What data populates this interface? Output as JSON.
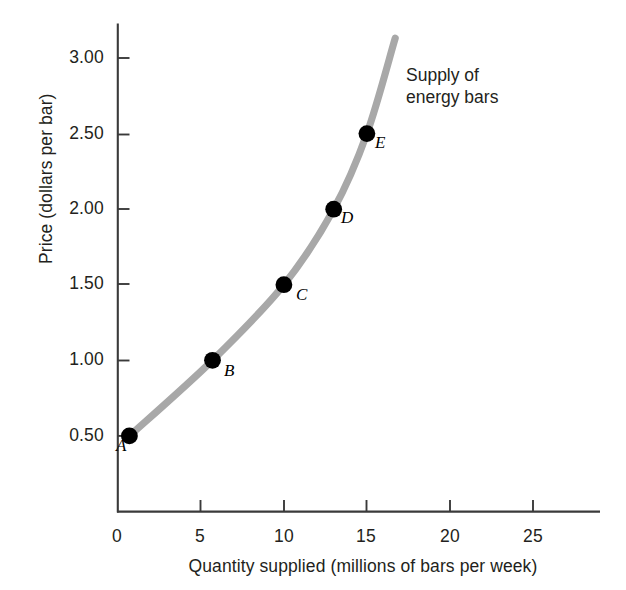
{
  "chart_data": {
    "type": "line",
    "title": "",
    "annotation": "Supply of energy bars",
    "annotation_line1": "Supply of",
    "annotation_line2": "energy bars",
    "xlabel": "Quantity supplied (millions of bars per week)",
    "ylabel": "Price (dollars per bar)",
    "xlim": [
      0,
      27.5
    ],
    "ylim": [
      0,
      3.3
    ],
    "grid": false,
    "legend": false,
    "curve_color": "#a8a8a8",
    "point_color": "#000000",
    "axis_color": "#3a3a3a",
    "xticks": [
      0,
      5,
      10,
      15,
      20,
      25
    ],
    "xtick_labels": [
      "0",
      "5",
      "10",
      "15",
      "20",
      "25"
    ],
    "yticks": [
      0.5,
      1.0,
      1.5,
      2.0,
      2.5,
      3.0
    ],
    "ytick_labels": [
      "0.50",
      "1.00",
      "1.50",
      "2.00",
      "2.50",
      "3.00"
    ],
    "series": [
      {
        "name": "Supply of energy bars",
        "x": [
          0.7,
          5.7,
          10.0,
          13.0,
          15.0
        ],
        "y": [
          0.5,
          1.0,
          1.5,
          2.0,
          2.5
        ]
      }
    ],
    "points": [
      {
        "label": "A",
        "x": 0.7,
        "y": 0.5
      },
      {
        "label": "B",
        "x": 5.7,
        "y": 1.0
      },
      {
        "label": "C",
        "x": 10.0,
        "y": 1.5
      },
      {
        "label": "D",
        "x": 13.0,
        "y": 2.0
      },
      {
        "label": "E",
        "x": 15.0,
        "y": 2.5
      }
    ],
    "curve_extends_to": {
      "x": 16.7,
      "y": 3.13
    }
  }
}
